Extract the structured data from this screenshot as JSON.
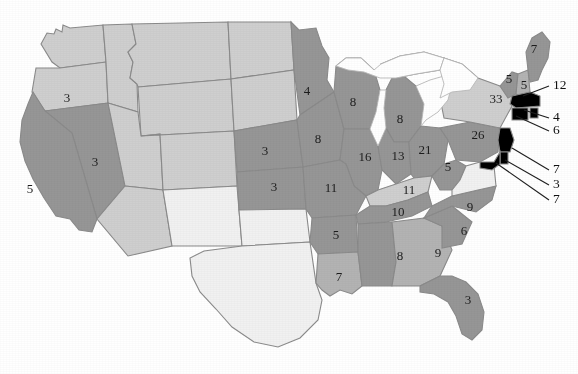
{
  "figure": {
    "type": "choropleth-map",
    "region": "United States",
    "value_kind": "number shown on each state",
    "shading_note": "three grayscale tones: dark gray, light gray, near-white"
  },
  "legend_tones": {
    "high": "#969696",
    "mid": "#b3b3b3",
    "low": "#cfcfcf",
    "verylow": "#f1f1f1",
    "border": "#8a8a8a",
    "text": "#1c1c1c",
    "background": "#ffffff"
  },
  "chart_data": {
    "type": "map",
    "title": "",
    "categories": [
      "OR",
      "CA",
      "NV",
      "NE",
      "KS",
      "MN",
      "IA",
      "WI",
      "MI",
      "IL",
      "IN",
      "OH",
      "WV",
      "KY",
      "MO",
      "AR",
      "LA",
      "TN",
      "AL",
      "GA",
      "SC",
      "NC",
      "FL",
      "NY",
      "PA",
      "VT",
      "NH",
      "ME",
      "MA",
      "RI",
      "CT",
      "NJ",
      "DE",
      "MD"
    ],
    "values": [
      3,
      5,
      3,
      3,
      3,
      4,
      8,
      8,
      8,
      16,
      13,
      21,
      5,
      11,
      11,
      5,
      7,
      10,
      8,
      9,
      6,
      9,
      3,
      33,
      26,
      5,
      5,
      7,
      12,
      4,
      6,
      7,
      3,
      7
    ]
  },
  "states": [
    {
      "code": "OR",
      "label": "3",
      "x": 67,
      "y": 99,
      "tone": "low"
    },
    {
      "code": "CA",
      "label": "5",
      "x": 30,
      "y": 190,
      "tone": "high"
    },
    {
      "code": "NV",
      "label": "3",
      "x": 95,
      "y": 163,
      "tone": "high"
    },
    {
      "code": "NE",
      "label": "3",
      "x": 265,
      "y": 152,
      "tone": "high"
    },
    {
      "code": "KS",
      "label": "3",
      "x": 274,
      "y": 188,
      "tone": "high"
    },
    {
      "code": "MN",
      "label": "4",
      "x": 307,
      "y": 92,
      "tone": "high"
    },
    {
      "code": "IA",
      "label": "8",
      "x": 318,
      "y": 140,
      "tone": "high"
    },
    {
      "code": "WI",
      "label": "8",
      "x": 353,
      "y": 103,
      "tone": "high"
    },
    {
      "code": "MI",
      "label": "8",
      "x": 400,
      "y": 120,
      "tone": "high"
    },
    {
      "code": "IL",
      "label": "16",
      "x": 365,
      "y": 158,
      "tone": "high"
    },
    {
      "code": "IN",
      "label": "13",
      "x": 398,
      "y": 157,
      "tone": "high"
    },
    {
      "code": "OH",
      "label": "21",
      "x": 425,
      "y": 151,
      "tone": "high"
    },
    {
      "code": "WV",
      "label": "5",
      "x": 448,
      "y": 168,
      "tone": "high"
    },
    {
      "code": "KY",
      "label": "11",
      "x": 409,
      "y": 191,
      "tone": "low"
    },
    {
      "code": "MO",
      "label": "11",
      "x": 331,
      "y": 189,
      "tone": "high"
    },
    {
      "code": "AR",
      "label": "5",
      "x": 336,
      "y": 236,
      "tone": "high"
    },
    {
      "code": "LA",
      "label": "7",
      "x": 339,
      "y": 278,
      "tone": "mid"
    },
    {
      "code": "TN",
      "label": "10",
      "x": 398,
      "y": 213,
      "tone": "high"
    },
    {
      "code": "AL",
      "label": "8",
      "x": 400,
      "y": 257,
      "tone": "high"
    },
    {
      "code": "GA",
      "label": "9",
      "x": 438,
      "y": 254,
      "tone": "mid"
    },
    {
      "code": "SC",
      "label": "6",
      "x": 464,
      "y": 232,
      "tone": "high"
    },
    {
      "code": "NC",
      "label": "9",
      "x": 470,
      "y": 208,
      "tone": "high"
    },
    {
      "code": "FL",
      "label": "3",
      "x": 468,
      "y": 301,
      "tone": "high"
    },
    {
      "code": "NY",
      "label": "33",
      "x": 496,
      "y": 100,
      "tone": "low"
    },
    {
      "code": "PA",
      "label": "26",
      "x": 478,
      "y": 136,
      "tone": "high"
    },
    {
      "code": "VT",
      "label": "5",
      "x": 509,
      "y": 80,
      "tone": "high"
    },
    {
      "code": "NH",
      "label": "5",
      "x": 524,
      "y": 86,
      "tone": "mid"
    },
    {
      "code": "ME",
      "label": "7",
      "x": 534,
      "y": 50,
      "tone": "high"
    }
  ],
  "callouts": [
    {
      "code": "MA",
      "label": "12",
      "tx": 553,
      "ty": 86,
      "x1": 549,
      "y1": 86,
      "x2": 523,
      "y2": 96
    },
    {
      "code": "RI",
      "label": "4",
      "tx": 553,
      "ty": 118,
      "x1": 549,
      "y1": 118,
      "x2": 524,
      "y2": 110
    },
    {
      "code": "CT",
      "label": "6",
      "tx": 553,
      "ty": 131,
      "x1": 549,
      "y1": 131,
      "x2": 516,
      "y2": 116
    },
    {
      "code": "NJ",
      "label": "7",
      "tx": 553,
      "ty": 170,
      "x1": 549,
      "y1": 170,
      "x2": 512,
      "y2": 148
    },
    {
      "code": "DE",
      "label": "3",
      "tx": 553,
      "ty": 185,
      "x1": 549,
      "y1": 185,
      "x2": 505,
      "y2": 160
    },
    {
      "code": "MD",
      "label": "7",
      "tx": 553,
      "ty": 200,
      "x1": 549,
      "y1": 200,
      "x2": 496,
      "y2": 163
    }
  ],
  "state_names": {
    "OR": "Oregon",
    "CA": "California",
    "NV": "Nevada",
    "NE": "Nebraska",
    "KS": "Kansas",
    "MN": "Minnesota",
    "IA": "Iowa",
    "WI": "Wisconsin",
    "MI": "Michigan",
    "IL": "Illinois",
    "IN": "Indiana",
    "OH": "Ohio",
    "WV": "West Virginia",
    "KY": "Kentucky",
    "MO": "Missouri",
    "AR": "Arkansas",
    "LA": "Louisiana",
    "TN": "Tennessee",
    "AL": "Alabama",
    "GA": "Georgia",
    "SC": "South Carolina",
    "NC": "North Carolina",
    "FL": "Florida",
    "NY": "New York",
    "PA": "Pennsylvania",
    "VT": "Vermont",
    "NH": "New Hampshire",
    "ME": "Maine",
    "MA": "Massachusetts",
    "RI": "Rhode Island",
    "CT": "Connecticut",
    "NJ": "New Jersey",
    "DE": "Delaware",
    "MD": "Maryland"
  }
}
